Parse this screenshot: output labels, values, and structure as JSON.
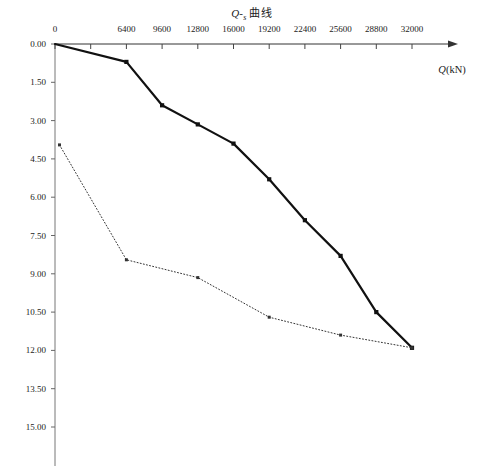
{
  "chart_data": {
    "type": "line",
    "title_parts": {
      "q": "Q",
      "dash": "-",
      "s": "s",
      "suffix": "曲线"
    },
    "xlabel": "Q(kN)",
    "xlabel_parts": {
      "symbol": "Q",
      "unit": "(kN)"
    },
    "ylabel": "",
    "xlim": [
      0,
      33800
    ],
    "ylim": [
      0,
      16.0
    ],
    "y_inverted": true,
    "grid": false,
    "legend": "none",
    "x_tick_labels": [
      "0",
      "",
      "6400",
      "9600",
      "12800",
      "16000",
      "19200",
      "22400",
      "25600",
      "28800",
      "32000"
    ],
    "x_tick_values": [
      0,
      3200,
      6400,
      9600,
      12800,
      16000,
      19200,
      22400,
      25600,
      28800,
      32000
    ],
    "y_tick_labels": [
      "0.00",
      "1.50",
      "3.00",
      "4.50",
      "6.00",
      "7.50",
      "9.00",
      "10.50",
      "12.00",
      "13.50",
      "15.00"
    ],
    "y_tick_values": [
      0.0,
      1.5,
      3.0,
      4.5,
      6.0,
      7.5,
      9.0,
      10.5,
      12.0,
      13.5,
      15.0
    ],
    "series": [
      {
        "name": "Q-s 曲线 (加载)",
        "style": "solid",
        "marker": "square",
        "color": "#111111",
        "x": [
          0,
          6400,
          9600,
          12800,
          16000,
          19200,
          22400,
          25600,
          28800,
          32000
        ],
        "values": [
          0.0,
          0.7,
          2.4,
          3.15,
          3.9,
          5.3,
          6.9,
          8.3,
          10.5,
          11.9
        ]
      },
      {
        "name": "s-lgQ 回弹 (卸载)",
        "style": "dotted",
        "marker": "square",
        "color": "#333333",
        "x": [
          400,
          6400,
          12800,
          19200,
          25600,
          32000
        ],
        "values": [
          3.95,
          8.45,
          9.15,
          10.7,
          11.4,
          11.9
        ]
      }
    ]
  }
}
